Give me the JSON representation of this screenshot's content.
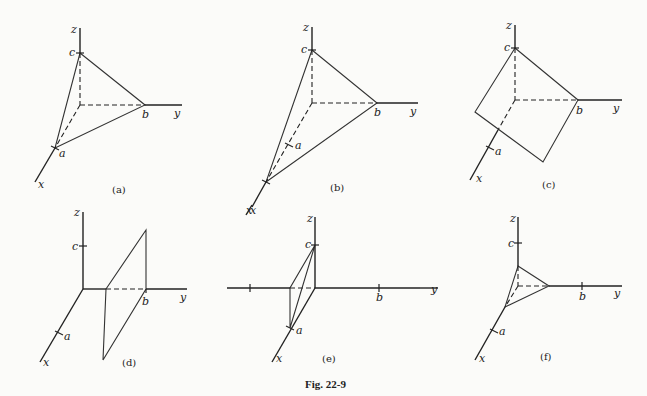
{
  "figure_caption": "Fig. 22-9",
  "colors": {
    "plane_light": "#e6e6e6",
    "plane_dark": "#b5b5b5",
    "ink": "#222222",
    "background": "#fbfbf9"
  },
  "axis_labels": {
    "x": "x",
    "y": "y",
    "z": "z"
  },
  "point_labels": {
    "a": "a",
    "b": "b",
    "c": "c"
  },
  "panels": [
    {
      "id": "a",
      "caption": "(a)",
      "description": "Plane intersecting all three axes at a, b, c (triangle)"
    },
    {
      "id": "b",
      "caption": "(b)",
      "description": "Plane with x-intercept beyond a"
    },
    {
      "id": "c",
      "caption": "(c)",
      "description": "Plane parallel to x-axis through b and c"
    },
    {
      "id": "d",
      "caption": "(d)",
      "description": "Plane parallel to xz-plane through b"
    },
    {
      "id": "e",
      "caption": "(e)",
      "description": "Plane through a and c with negative y-intercept"
    },
    {
      "id": "f",
      "caption": "(f)",
      "description": "Small triangle with intercepts inside a, b, c"
    }
  ]
}
